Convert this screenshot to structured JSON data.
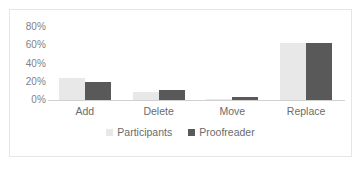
{
  "chart_data": {
    "type": "bar",
    "title": "",
    "xlabel": "",
    "ylabel": "",
    "categories": [
      "Add",
      "Delete",
      "Move",
      "Replace"
    ],
    "series": [
      {
        "name": "Participants",
        "color": "#e8e8e8",
        "values": [
          24,
          9,
          0.5,
          62
        ]
      },
      {
        "name": "Proofreader",
        "color": "#595959",
        "values": [
          20,
          11,
          3,
          62
        ]
      }
    ],
    "ylim": [
      0,
      80
    ],
    "ytick_values": [
      80,
      60,
      40,
      20,
      0
    ],
    "ytick_labels": [
      "80%",
      "60%",
      "40%",
      "20%",
      "0%"
    ],
    "grid": false,
    "legend_position": "bottom",
    "axis_color": "#d0d0d0",
    "tick_label_color": "#7f7f7f",
    "frame_color": "#e6e6e6",
    "background": "#ffffff"
  }
}
